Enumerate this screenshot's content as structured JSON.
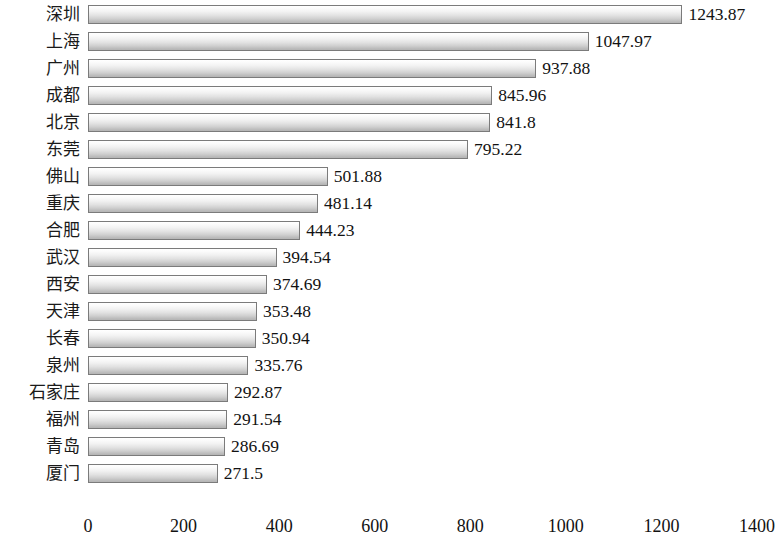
{
  "chart_data": {
    "type": "bar",
    "orientation": "horizontal",
    "title": "",
    "subtitle": "",
    "xlabel": "",
    "ylabel": "",
    "xlim": [
      0,
      1400
    ],
    "xticks": [
      "0",
      "200",
      "400",
      "600",
      "800",
      "1000",
      "1200",
      "1400"
    ],
    "xtick_values": [
      0,
      200,
      400,
      600,
      800,
      1000,
      1200,
      1400
    ],
    "grid": false,
    "legend": null,
    "categories": [
      "深圳",
      "上海",
      "广州",
      "成都",
      "北京",
      "东莞",
      "佛山",
      "重庆",
      "合肥",
      "武汉",
      "西安",
      "天津",
      "长春",
      "泉州",
      "石家庄",
      "福州",
      "青岛",
      "厦门"
    ],
    "values": [
      1243.87,
      1047.97,
      937.88,
      845.96,
      841.8,
      795.22,
      501.88,
      481.14,
      444.23,
      394.54,
      374.69,
      353.48,
      350.94,
      335.76,
      292.87,
      291.54,
      286.69,
      271.5
    ],
    "value_labels": [
      "1243.87",
      "1047.97",
      "937.88",
      "845.96",
      "841.8",
      "795.22",
      "501.88",
      "481.14",
      "444.23",
      "394.54",
      "374.69",
      "353.48",
      "350.94",
      "335.76",
      "292.87",
      "291.54",
      "286.69",
      "271.5"
    ],
    "bar_fill_top": "#ffffff",
    "bar_fill_bottom": "#b4b4b4",
    "bar_border": "#7b7b7b",
    "background": "#ffffff",
    "text_color": "#121212"
  }
}
